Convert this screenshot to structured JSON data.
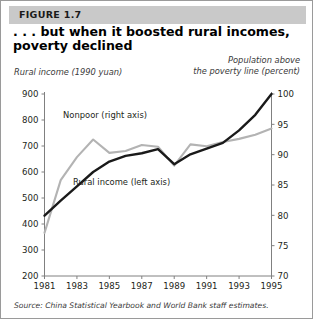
{
  "figure": {
    "header_label": "FIGURE 1.7",
    "title_line1": ". . . but when it boosted rural incomes,",
    "title_line2": "poverty declined",
    "left_axis_caption": "Rural income (1990 yuan)",
    "right_axis_caption_line1": "Population above",
    "right_axis_caption_line2": "the poverty line (percent)",
    "source_prefix": "Source:",
    "source_italic": "China Statistical Yearbook",
    "source_suffix": "and World Bank staff estimates."
  },
  "colors": {
    "rural_income_line": "#1a1a1a",
    "nonpoor_line": "#b3b3b3",
    "axis": "#808080",
    "header_band": "#c9c9c9",
    "card_border": "#9a9a9a",
    "text": "#231f20"
  },
  "chart_data": {
    "type": "line",
    "title": ". . . but when it boosted rural incomes, poverty declined",
    "xlabel": "",
    "ylabel": "Rural income (1990 yuan)",
    "y2label": "Population above the poverty line (percent)",
    "grid": false,
    "legend": "inline-annotations",
    "x": [
      1981,
      1982,
      1983,
      1984,
      1985,
      1986,
      1987,
      1988,
      1989,
      1990,
      1991,
      1992,
      1993,
      1994,
      1995
    ],
    "xtick_labels": [
      "1981",
      "1983",
      "1985",
      "1987",
      "1989",
      "1991",
      "1993",
      "1995"
    ],
    "xtick_values": [
      1981,
      1983,
      1985,
      1987,
      1989,
      1991,
      1993,
      1995
    ],
    "xlim": [
      1981,
      1995
    ],
    "ylim": [
      200,
      900
    ],
    "ytick_labels": [
      "200",
      "300",
      "400",
      "500",
      "600",
      "700",
      "800",
      "900"
    ],
    "ytick_values": [
      200,
      300,
      400,
      500,
      600,
      700,
      800,
      900
    ],
    "y2lim": [
      70,
      100
    ],
    "y2tick_labels": [
      "70",
      "75",
      "80",
      "85",
      "90",
      "95",
      "100"
    ],
    "y2tick_values": [
      70,
      75,
      80,
      85,
      90,
      95,
      100
    ],
    "series": [
      {
        "name": "Rural income (left axis)",
        "axis": "left",
        "color": "#1a1a1a",
        "label_text": "Rural income (left axis)",
        "values": [
          432,
          490,
          545,
          600,
          640,
          662,
          672,
          688,
          630,
          668,
          690,
          712,
          760,
          820,
          900
        ]
      },
      {
        "name": "Nonpoor (right axis)",
        "axis": "right",
        "color": "#b3b3b3",
        "label_text": "Nonpoor (right axis)",
        "values": [
          77.1,
          85.8,
          89.6,
          92.5,
          90.3,
          90.6,
          91.6,
          91.3,
          88.2,
          91.7,
          91.4,
          92.1,
          92.6,
          93.3,
          94.3
        ]
      }
    ]
  }
}
